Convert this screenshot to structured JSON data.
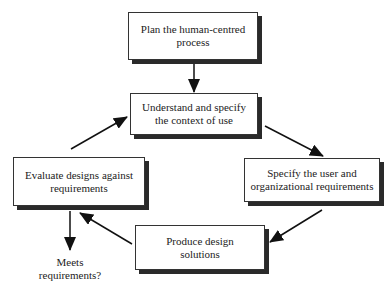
{
  "diagram": {
    "type": "cycle-flowchart",
    "nodes": [
      {
        "id": "plan",
        "lines": [
          "Plan the human-centred",
          "process"
        ]
      },
      {
        "id": "understand",
        "lines": [
          "Understand and specify",
          "the context of use"
        ]
      },
      {
        "id": "specify",
        "lines": [
          "Specify the user and",
          "organizational requirements"
        ]
      },
      {
        "id": "produce",
        "lines": [
          "Produce design",
          "solutions"
        ]
      },
      {
        "id": "evaluate",
        "lines": [
          "Evaluate designs against",
          "requirements"
        ]
      }
    ],
    "outcome": {
      "id": "meets",
      "lines": [
        "Meets",
        "requirements?"
      ]
    },
    "edges": [
      {
        "from": "plan",
        "to": "understand"
      },
      {
        "from": "understand",
        "to": "specify"
      },
      {
        "from": "specify",
        "to": "produce"
      },
      {
        "from": "produce",
        "to": "evaluate"
      },
      {
        "from": "evaluate",
        "to": "understand"
      },
      {
        "from": "evaluate",
        "to": "meets"
      }
    ]
  }
}
